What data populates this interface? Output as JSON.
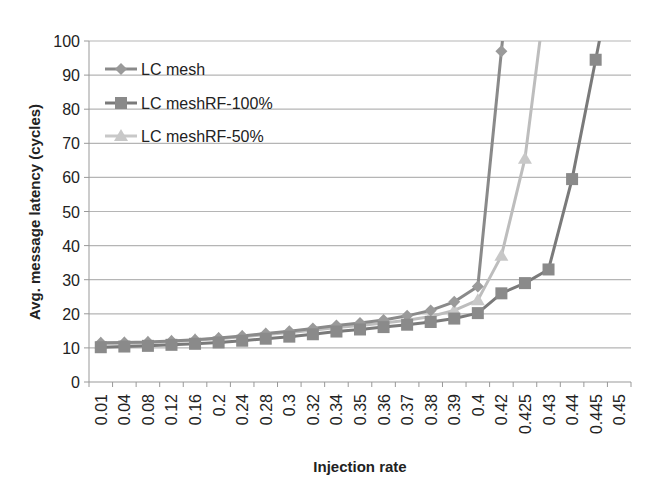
{
  "chart_data": {
    "type": "line",
    "title": "",
    "xlabel": "Injection rate",
    "ylabel": "Avg. message latency (cycles)",
    "ylim": [
      0,
      100
    ],
    "yticks": [
      0,
      10,
      20,
      30,
      40,
      50,
      60,
      70,
      80,
      90,
      100
    ],
    "grid": true,
    "legend_position": "upper-left",
    "categories": [
      "0.01",
      "0.04",
      "0.08",
      "0.12",
      "0.16",
      "0.2",
      "0.24",
      "0.28",
      "0.3",
      "0.32",
      "0.34",
      "0.35",
      "0.36",
      "0.37",
      "0.38",
      "0.39",
      "0.4",
      "0.42",
      "0.425",
      "0.43",
      "0.44",
      "0.445",
      "0.45"
    ],
    "series": [
      {
        "name": "LC mesh",
        "marker": "diamond",
        "color": "#8a8a8a",
        "values": [
          11.5,
          11.6,
          11.7,
          12.0,
          12.4,
          12.9,
          13.5,
          14.2,
          14.9,
          15.7,
          16.6,
          17.3,
          18.2,
          19.4,
          21.0,
          23.5,
          28.0,
          97.0,
          null,
          null,
          null,
          null,
          null
        ]
      },
      {
        "name": "LC meshRF-100%",
        "marker": "square",
        "color": "#7a7a7a",
        "values": [
          10.2,
          10.4,
          10.6,
          10.9,
          11.2,
          11.6,
          12.1,
          12.7,
          13.3,
          14.0,
          14.8,
          15.4,
          16.1,
          16.8,
          17.6,
          18.6,
          20.2,
          26.0,
          29.0,
          33.0,
          59.5,
          94.5,
          null
        ]
      },
      {
        "name": "LC meshRF-50%",
        "marker": "triangle",
        "color": "#bdbdbd",
        "values": [
          11.3,
          11.4,
          11.6,
          11.9,
          12.3,
          12.7,
          13.3,
          13.9,
          14.5,
          15.2,
          16.0,
          16.6,
          17.3,
          18.1,
          19.2,
          21.0,
          24.0,
          37.0,
          65.5,
          null,
          null,
          null,
          null
        ]
      }
    ]
  },
  "legend": {
    "items": [
      {
        "label": "LC mesh"
      },
      {
        "label": "LC meshRF-100%"
      },
      {
        "label": "LC meshRF-50%"
      }
    ]
  }
}
